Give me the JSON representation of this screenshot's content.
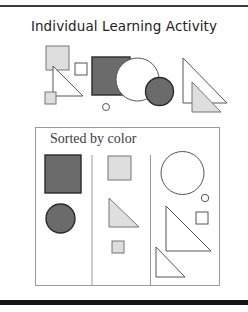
{
  "title": "Individual Learning Activity",
  "sorted_panel": {
    "label": "Sorted by color",
    "columns": [
      "dark-gray",
      "light-gray",
      "white"
    ]
  },
  "colors": {
    "dark": {
      "fill": "#6b6b6b",
      "stroke": "#2a2a2a"
    },
    "light": {
      "fill": "#dedede",
      "stroke": "#777777"
    },
    "white": {
      "fill": "#ffffff",
      "stroke": "#555555"
    },
    "rule": "#222222",
    "box_border": "#9a9a9a"
  },
  "mixed_shapes": [
    {
      "name": "light-large-square",
      "type": "rect",
      "x": 46,
      "y": 46,
      "w": 23,
      "h": 24,
      "color": "light"
    },
    {
      "name": "white-right-triangle",
      "type": "poly",
      "points": "53,66 53,96 83,96",
      "color": "white"
    },
    {
      "name": "white-small-square",
      "type": "rect",
      "x": 75,
      "y": 63,
      "w": 12,
      "h": 12,
      "color": "white"
    },
    {
      "name": "light-small-square",
      "type": "rect",
      "x": 45,
      "y": 92,
      "w": 11,
      "h": 12,
      "color": "light"
    },
    {
      "name": "dark-large-square",
      "type": "rect",
      "x": 92,
      "y": 57,
      "w": 38,
      "h": 38,
      "color": "dark"
    },
    {
      "name": "white-large-circle",
      "type": "circle",
      "cx": 137.5,
      "cy": 79.5,
      "r": 21.5,
      "color": "white"
    },
    {
      "name": "dark-circle",
      "type": "circle",
      "cx": 159.5,
      "cy": 91.5,
      "r": 14,
      "color": "dark"
    },
    {
      "name": "white-small-circle",
      "type": "circle",
      "cx": 106,
      "cy": 107,
      "r": 3.5,
      "color": "white"
    },
    {
      "name": "white-large-triangle",
      "type": "poly",
      "points": "183,58 183,103 227,103",
      "color": "white"
    },
    {
      "name": "light-triangle",
      "type": "poly",
      "points": "192,82 192,112 221,112",
      "color": "light"
    }
  ],
  "sorted_shapes": [
    {
      "name": "col1-dark-square",
      "type": "rect",
      "x": 45,
      "y": 155,
      "w": 36,
      "h": 38,
      "color": "dark"
    },
    {
      "name": "col1-dark-circle",
      "type": "circle",
      "cx": 60.5,
      "cy": 218.5,
      "r": 14.5,
      "color": "dark"
    },
    {
      "name": "col2-light-square",
      "type": "rect",
      "x": 108,
      "y": 156,
      "w": 23,
      "h": 24,
      "color": "light"
    },
    {
      "name": "col2-light-triangle",
      "type": "poly",
      "points": "109,198 109,227 139,227",
      "color": "light"
    },
    {
      "name": "col2-light-small-square",
      "type": "rect",
      "x": 112,
      "y": 241,
      "w": 12,
      "h": 12,
      "color": "light"
    },
    {
      "name": "col3-white-large-circle",
      "type": "circle",
      "cx": 182.5,
      "cy": 173,
      "r": 21.5,
      "color": "white"
    },
    {
      "name": "col3-white-small-circle",
      "type": "circle",
      "cx": 205,
      "cy": 198,
      "r": 3.7,
      "color": "white"
    },
    {
      "name": "col3-white-small-square",
      "type": "rect",
      "x": 196,
      "y": 212,
      "w": 12,
      "h": 12,
      "color": "white"
    },
    {
      "name": "col3-white-large-triangle",
      "type": "poly",
      "points": "166,206 166,251 211,251",
      "color": "white"
    },
    {
      "name": "col3-white-small-triangle",
      "type": "poly",
      "points": "156,247 156,277 185,277",
      "color": "white"
    }
  ],
  "dividers": [
    {
      "name": "column-divider-1",
      "x": 92,
      "y1": 155,
      "y2": 285
    },
    {
      "name": "column-divider-2",
      "x": 150.5,
      "y1": 155,
      "y2": 285
    }
  ]
}
